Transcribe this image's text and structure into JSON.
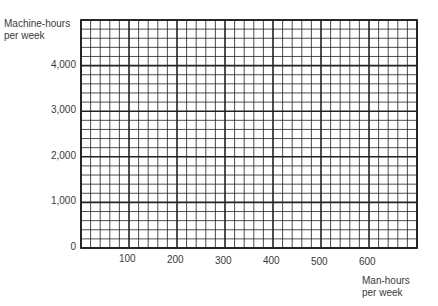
{
  "chart_data": {
    "type": "line",
    "title": "",
    "xlabel": "Man-hours per week",
    "ylabel": "Machine-hours per week",
    "xlim": [
      0,
      700
    ],
    "ylim": [
      0,
      5000
    ],
    "x_ticks": [
      "100",
      "200",
      "300",
      "400",
      "500",
      "600"
    ],
    "y_ticks": [
      "0",
      "1,000",
      "2,000",
      "3,000",
      "4,000"
    ],
    "grid": true,
    "grid_minor_divisions": 5,
    "series": []
  },
  "labels": {
    "ylabel_line1": "Machine-hours",
    "ylabel_line2": "per week",
    "xlabel_line1": "Man-hours",
    "xlabel_line2": "per week"
  }
}
